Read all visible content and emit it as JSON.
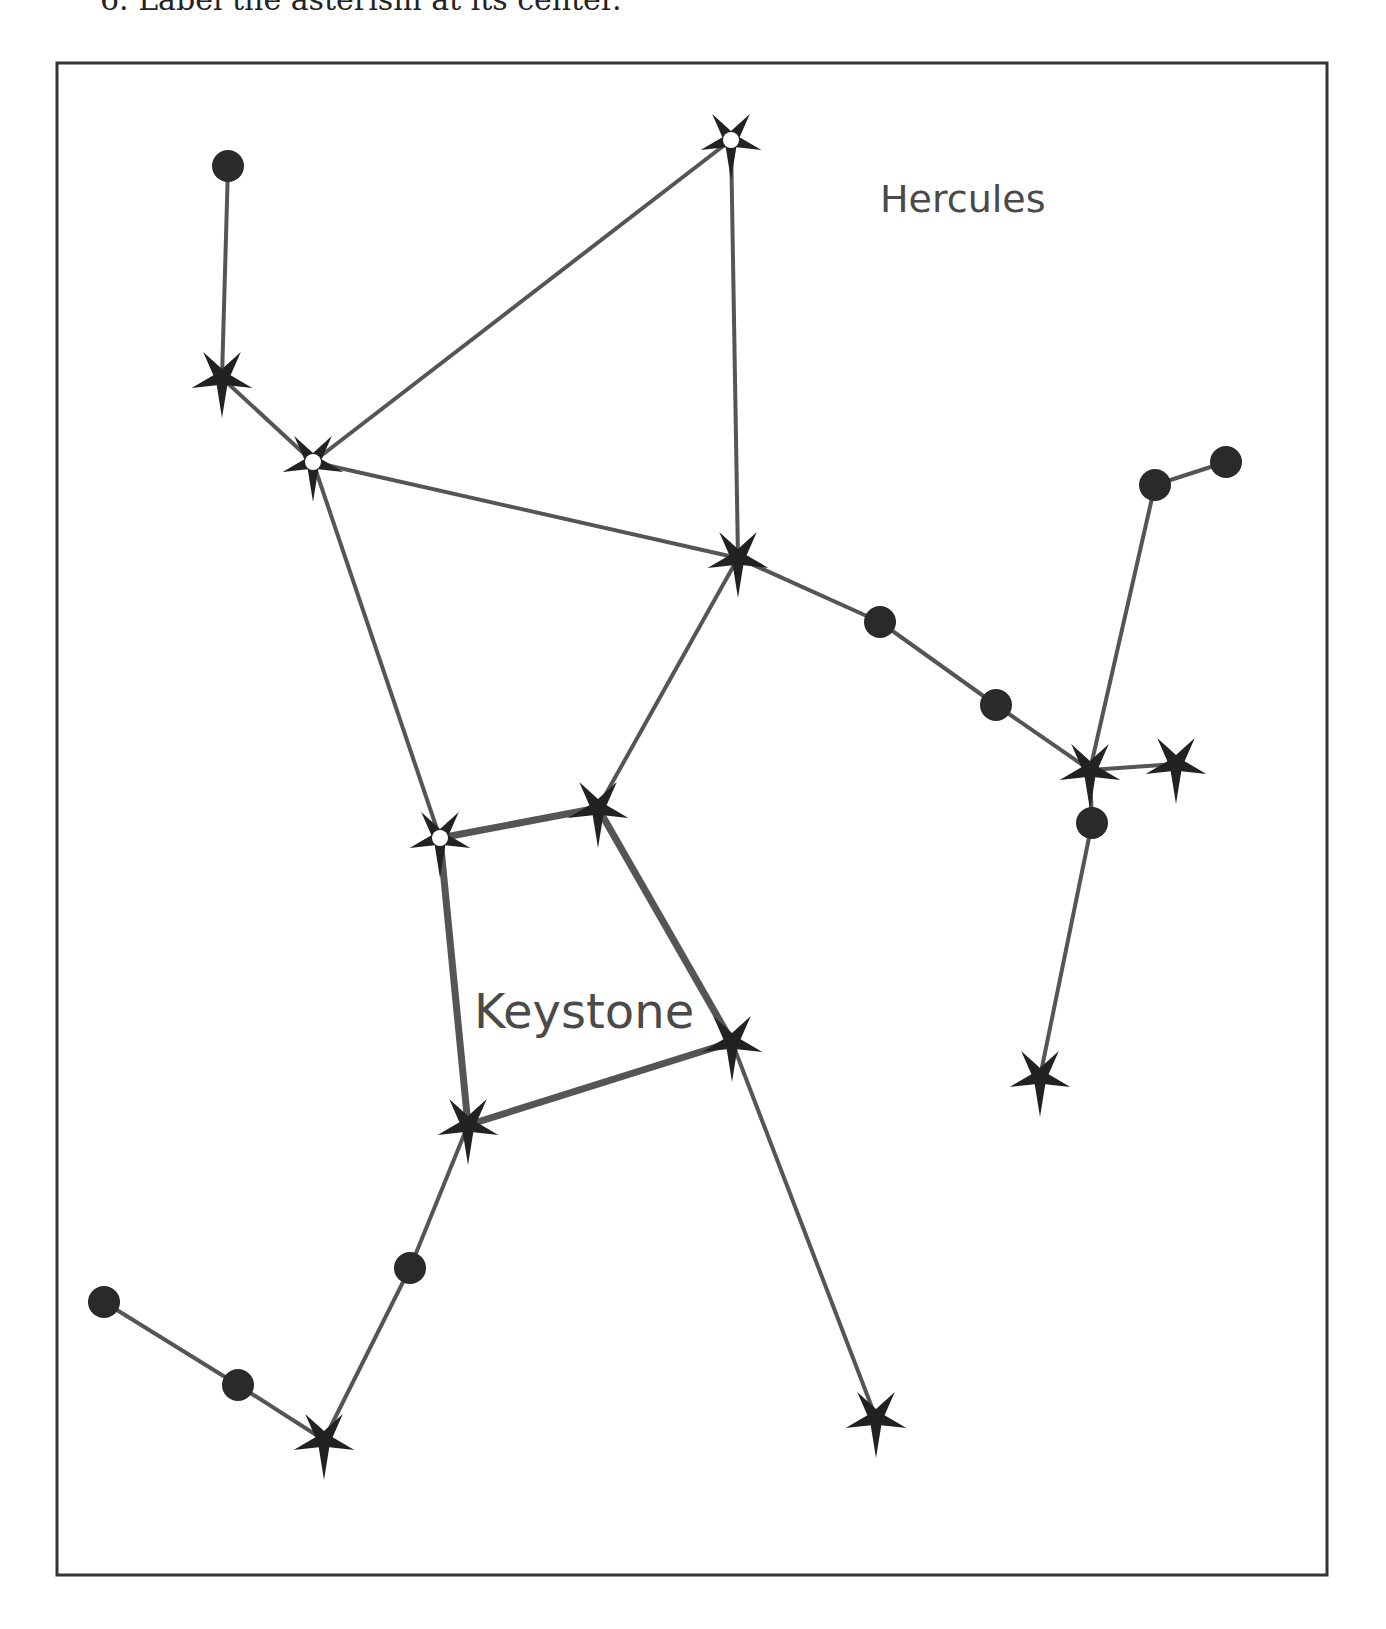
{
  "instruction": "6.  Label the asterism at its center.",
  "frame": {
    "x": 57,
    "y": 63,
    "width": 1270,
    "height": 1512,
    "stroke": "#333333"
  },
  "colors": {
    "line": "#555555",
    "star": "#222222",
    "dot": "#2a2a2a",
    "label": "#4a4a4a"
  },
  "labels": {
    "constellation": {
      "text": "Hercules",
      "x": 880,
      "y": 212,
      "size": 38
    },
    "asterism": {
      "text": "Keystone",
      "x": 474,
      "y": 1028,
      "size": 48
    }
  },
  "stars": [
    {
      "id": "s1",
      "type": "dot",
      "x": 228,
      "y": 166
    },
    {
      "id": "s2",
      "type": "star",
      "x": 222,
      "y": 378
    },
    {
      "id": "s3",
      "type": "star-hollow",
      "x": 313,
      "y": 462
    },
    {
      "id": "s4",
      "type": "star-hollow",
      "x": 731,
      "y": 140
    },
    {
      "id": "s5",
      "type": "star",
      "x": 738,
      "y": 558
    },
    {
      "id": "s6",
      "type": "dot",
      "x": 880,
      "y": 622
    },
    {
      "id": "s7",
      "type": "dot",
      "x": 996,
      "y": 705
    },
    {
      "id": "s8",
      "type": "star",
      "x": 1090,
      "y": 770
    },
    {
      "id": "s9",
      "type": "star",
      "x": 1176,
      "y": 764
    },
    {
      "id": "s10",
      "type": "dot",
      "x": 1155,
      "y": 485
    },
    {
      "id": "s11",
      "type": "dot",
      "x": 1226,
      "y": 462
    },
    {
      "id": "s12",
      "type": "dot",
      "x": 1092,
      "y": 823
    },
    {
      "id": "s13",
      "type": "star",
      "x": 1040,
      "y": 1077
    },
    {
      "id": "s14",
      "type": "star-hollow",
      "x": 440,
      "y": 838
    },
    {
      "id": "s15",
      "type": "star",
      "x": 598,
      "y": 808
    },
    {
      "id": "s16",
      "type": "star",
      "x": 732,
      "y": 1042
    },
    {
      "id": "s17",
      "type": "star",
      "x": 468,
      "y": 1125
    },
    {
      "id": "s18",
      "type": "dot",
      "x": 410,
      "y": 1268
    },
    {
      "id": "s19",
      "type": "star",
      "x": 324,
      "y": 1440
    },
    {
      "id": "s20",
      "type": "dot",
      "x": 238,
      "y": 1385
    },
    {
      "id": "s21",
      "type": "dot",
      "x": 104,
      "y": 1302
    },
    {
      "id": "s22",
      "type": "star",
      "x": 876,
      "y": 1418
    }
  ],
  "lines": [
    {
      "from": "s1",
      "to": "s2",
      "w": 4
    },
    {
      "from": "s2",
      "to": "s3",
      "w": 4
    },
    {
      "from": "s3",
      "to": "s4",
      "w": 4
    },
    {
      "from": "s4",
      "to": "s5",
      "w": 4
    },
    {
      "from": "s3",
      "to": "s5",
      "w": 4
    },
    {
      "from": "s3",
      "to": "s14",
      "w": 4
    },
    {
      "from": "s5",
      "to": "s15",
      "w": 4
    },
    {
      "from": "s5",
      "to": "s6",
      "w": 4
    },
    {
      "from": "s6",
      "to": "s7",
      "w": 4
    },
    {
      "from": "s7",
      "to": "s8",
      "w": 4
    },
    {
      "from": "s8",
      "to": "s9",
      "w": 4
    },
    {
      "from": "s8",
      "to": "s10",
      "w": 4
    },
    {
      "from": "s10",
      "to": "s11",
      "w": 4
    },
    {
      "from": "s8",
      "to": "s12",
      "w": 4
    },
    {
      "from": "s12",
      "to": "s13",
      "w": 4
    },
    {
      "from": "s14",
      "to": "s15",
      "w": 7
    },
    {
      "from": "s15",
      "to": "s16",
      "w": 7
    },
    {
      "from": "s16",
      "to": "s17",
      "w": 7
    },
    {
      "from": "s17",
      "to": "s14",
      "w": 7
    },
    {
      "from": "s16",
      "to": "s22",
      "w": 4
    },
    {
      "from": "s17",
      "to": "s18",
      "w": 4
    },
    {
      "from": "s18",
      "to": "s19",
      "w": 4
    },
    {
      "from": "s19",
      "to": "s20",
      "w": 4
    },
    {
      "from": "s20",
      "to": "s21",
      "w": 4
    }
  ]
}
